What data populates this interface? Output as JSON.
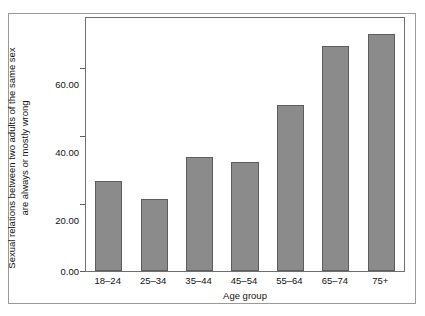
{
  "chart_data": {
    "type": "bar",
    "title": "",
    "subtitle": "",
    "categories": [
      "18–24",
      "25–34",
      "35–44",
      "45–54",
      "55–64",
      "65–74",
      "75+"
    ],
    "values": [
      26.7,
      21.4,
      34.0,
      32.3,
      49.3,
      67.0,
      70.4
    ],
    "series": [
      {
        "name": "Sexual relations between two adults of the same sex are always or mostly wrong",
        "values": [
          26.7,
          21.4,
          34.0,
          32.3,
          49.3,
          67.0,
          70.4
        ]
      }
    ],
    "xlabel": "Age group",
    "ylabel": "Sexual relations between two adults of the same sex\nare always or mostly wrong",
    "ylim": [
      0,
      75.3
    ],
    "yticks": [
      0,
      20,
      40,
      60
    ],
    "ytick_labels": [
      "0.00",
      "20.00",
      "40.00",
      "60.00"
    ],
    "grid": false,
    "legend": "none",
    "bar_color": "#8b8b8b",
    "bar_edge_color": "#5d5d5d",
    "axis_color": "#6f6f6f",
    "frame_color": "#9a9a9a",
    "background_color": "#ffffff"
  },
  "axes": {
    "x_title": "Age group",
    "y_title_line1": "Sexual relations between two adults of the same sex",
    "y_title_line2": "are always or mostly wrong"
  }
}
